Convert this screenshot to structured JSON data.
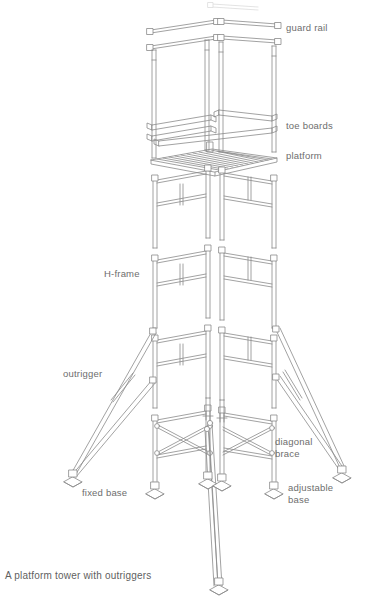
{
  "figure": {
    "caption": "A platform tower with outriggers",
    "stroke_color": "#8a8a8a",
    "label_color": "#6d6d6d",
    "background_color": "#ffffff"
  },
  "labels": [
    {
      "id": "guard-rail",
      "text": "guard rail",
      "x": 286,
      "y": 22
    },
    {
      "id": "toe-boards",
      "text": "toe boards",
      "x": 286,
      "y": 120
    },
    {
      "id": "platform",
      "text": "platform",
      "x": 286,
      "y": 150
    },
    {
      "id": "h-frame",
      "text": "H-frame",
      "x": 104,
      "y": 268
    },
    {
      "id": "outrigger",
      "text": "outrigger",
      "x": 63,
      "y": 368
    },
    {
      "id": "diagonal-brace",
      "text": "diagonal\nbrace",
      "x": 275,
      "y": 436
    },
    {
      "id": "fixed-base",
      "text": "fixed base",
      "x": 82,
      "y": 487
    },
    {
      "id": "adjustable-base",
      "text": "adjustable\nbase",
      "x": 288,
      "y": 482
    }
  ],
  "parts": [
    {
      "name": "guard rail",
      "count": 4,
      "description": "horizontal tube rails with square end connectors"
    },
    {
      "name": "guard rail post",
      "count": 4,
      "description": "vertical tubes carrying the guard rails"
    },
    {
      "name": "toe board",
      "count": 4,
      "description": "flat boards with notched overlapping ends forming a rectangle"
    },
    {
      "name": "platform",
      "count": 1,
      "description": "slatted deck panel"
    },
    {
      "name": "H-frame",
      "count": 4,
      "description": "stacked ladder-type frames forming the tower body"
    },
    {
      "name": "diagonal brace",
      "count": 4,
      "description": "crossed tubes stiffening the tower base"
    },
    {
      "name": "outrigger",
      "count": 2,
      "description": "angled stabiliser struts with cross tie"
    },
    {
      "name": "fixed base",
      "count": 2,
      "description": "plain base plate at foot of outrigger"
    },
    {
      "name": "adjustable base",
      "count": 4,
      "description": "screw-jack base plate under each leg"
    }
  ]
}
